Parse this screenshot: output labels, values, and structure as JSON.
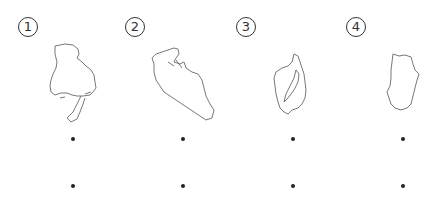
{
  "figure": {
    "items": [
      {
        "label": "1",
        "symbol": "①",
        "shape": "map-outline-hyogo"
      },
      {
        "label": "2",
        "symbol": "②",
        "shape": "map-outline-kyoto"
      },
      {
        "label": "3",
        "symbol": "③",
        "shape": "map-outline-shiga"
      },
      {
        "label": "4",
        "symbol": "④",
        "shape": "map-outline-nara"
      }
    ],
    "bullets_per_item": 2
  }
}
